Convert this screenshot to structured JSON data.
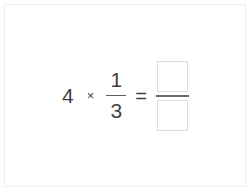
{
  "card": {
    "border_color": "#efefef",
    "background": "#ffffff"
  },
  "problem": {
    "type": "fraction-multiplication",
    "whole_number": "4",
    "multiply_symbol": "×",
    "fraction": {
      "numerator": "1",
      "denominator": "3"
    },
    "equals_symbol": "=",
    "answer": {
      "numerator_value": "",
      "denominator_value": "",
      "numerator_placeholder": "",
      "denominator_placeholder": ""
    }
  },
  "colors": {
    "text": "#3f3f3f",
    "fraction_bar": "#5a5a5a",
    "answer_bar": "#6b6b6b",
    "input_border": "#dcdcdc"
  }
}
